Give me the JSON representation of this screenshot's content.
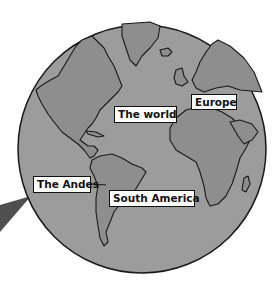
{
  "diagram": {
    "type": "labeled-globe-map",
    "colors": {
      "ocean": "#9c9c9c",
      "land": "#8e8e8e",
      "outline": "#1a1a1a",
      "pointer": "#4f4f4f",
      "label_bg": "#ffffff"
    },
    "labels": {
      "world": "The world",
      "europe": "Europe",
      "south_america": "South America",
      "andes": "The Andes"
    }
  }
}
